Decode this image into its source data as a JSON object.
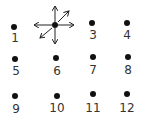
{
  "diagram": {
    "ink_color": "#111111",
    "label_color": "#333333",
    "points": [
      {
        "label": "1",
        "x": 14,
        "y": 27,
        "lx": 15,
        "ly": 38
      },
      {
        "label": "",
        "x": 55,
        "y": 25,
        "lx": 55,
        "ly": 36,
        "has_arrows": true
      },
      {
        "label": "3",
        "x": 92,
        "y": 23,
        "lx": 93,
        "ly": 35
      },
      {
        "label": "4",
        "x": 127,
        "y": 23,
        "lx": 127,
        "ly": 35
      },
      {
        "label": "5",
        "x": 15,
        "y": 59,
        "lx": 16,
        "ly": 71
      },
      {
        "label": "6",
        "x": 56,
        "y": 58,
        "lx": 57,
        "ly": 71
      },
      {
        "label": "7",
        "x": 93,
        "y": 57,
        "lx": 93,
        "ly": 70
      },
      {
        "label": "8",
        "x": 128,
        "y": 57,
        "lx": 128,
        "ly": 70
      },
      {
        "label": "9",
        "x": 15,
        "y": 96,
        "lx": 16,
        "ly": 109
      },
      {
        "label": "10",
        "x": 57,
        "y": 96,
        "lx": 57,
        "ly": 108
      },
      {
        "label": "11",
        "x": 93,
        "y": 94,
        "lx": 93,
        "ly": 108
      },
      {
        "label": "12",
        "x": 127,
        "y": 94,
        "lx": 127,
        "ly": 108
      }
    ],
    "arrows": {
      "origin": {
        "x": 55,
        "y": 25
      },
      "directions": [
        "up",
        "up-right",
        "right",
        "left",
        "down-left",
        "down"
      ]
    }
  }
}
